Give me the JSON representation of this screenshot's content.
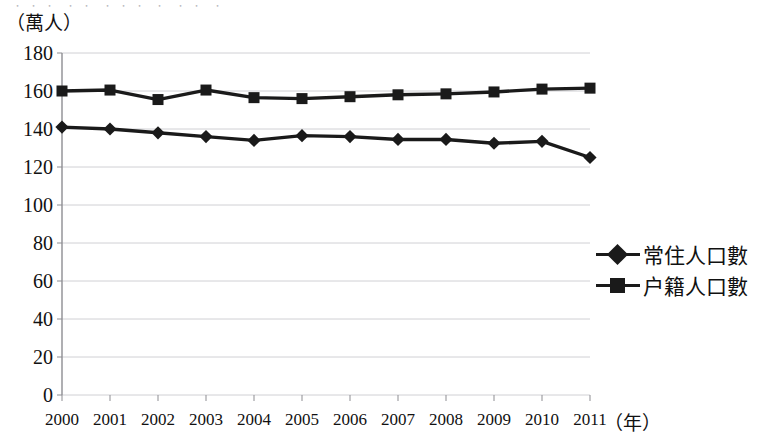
{
  "top_partial_text": "﹒﹒﹒ ﹒﹒ ﹒﹒﹒ ﹒ ﹒﹒ ﹒",
  "axes": {
    "y_unit_label": "（萬人）",
    "x_unit_label": "（年）",
    "y_ticks": [
      "180",
      "160",
      "140",
      "120",
      "100",
      "80",
      "60",
      "40",
      "20",
      "0"
    ],
    "x_ticks": [
      "2000",
      "2001",
      "2002",
      "2003",
      "2004",
      "2005",
      "2006",
      "2007",
      "2008",
      "2009",
      "2010",
      "2011"
    ]
  },
  "legend": {
    "position": "right-middle",
    "entries": [
      {
        "label": "常住人口數",
        "marker": "diamond-icon",
        "color": "#1a1a1a"
      },
      {
        "label": "户籍人口數",
        "marker": "square-icon",
        "color": "#1a1a1a"
      }
    ]
  },
  "chart_data": {
    "type": "line",
    "title": "",
    "subtitle": "",
    "xlabel": "（年）",
    "ylabel": "（萬人）",
    "xlim": [
      2000,
      2011
    ],
    "ylim": [
      0,
      180
    ],
    "y_tick_step": 20,
    "grid": true,
    "grid_axis": "y",
    "legend_position": "right",
    "categories": [
      "2000",
      "2001",
      "2002",
      "2003",
      "2004",
      "2005",
      "2006",
      "2007",
      "2008",
      "2009",
      "2010",
      "2011"
    ],
    "x": [
      2000,
      2001,
      2002,
      2003,
      2004,
      2005,
      2006,
      2007,
      2008,
      2009,
      2010,
      2011
    ],
    "series": [
      {
        "name": "常住人口數",
        "marker": "diamond",
        "color": "#1a1a1a",
        "values": [
          141,
          140,
          138,
          136,
          134,
          136.5,
          136,
          134.5,
          134.5,
          132.5,
          133.5,
          125
        ]
      },
      {
        "name": "户籍人口數",
        "marker": "square",
        "color": "#1a1a1a",
        "values": [
          160,
          160.5,
          155.5,
          160.5,
          156.5,
          156,
          157,
          158,
          158.5,
          159.5,
          161,
          161.5
        ]
      }
    ],
    "annotations": []
  }
}
